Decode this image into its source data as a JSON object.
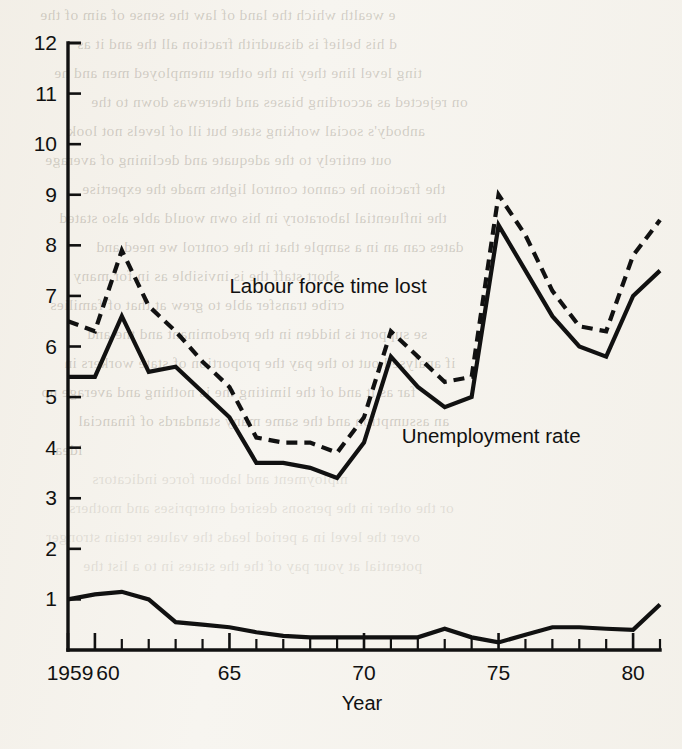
{
  "chart_data": {
    "type": "line",
    "title": "",
    "xlabel": "Year",
    "ylabel": "",
    "xlim": [
      1959,
      1981
    ],
    "ylim": [
      0,
      12
    ],
    "grid": false,
    "legend": "inline-annotations",
    "x_tick_labels": [
      "1959",
      "60",
      "65",
      "70",
      "75",
      "80"
    ],
    "x_tick_values": [
      1959,
      1960,
      1965,
      1970,
      1975,
      1980
    ],
    "x_minor_ticks_every": 1,
    "y_tick_labels": [
      "1",
      "2",
      "3",
      "4",
      "5",
      "6",
      "7",
      "8",
      "9",
      "10",
      "11",
      "12"
    ],
    "y_tick_values": [
      1,
      2,
      3,
      4,
      5,
      6,
      7,
      8,
      9,
      10,
      11,
      12
    ],
    "x": [
      1959,
      1960,
      1961,
      1962,
      1963,
      1964,
      1965,
      1966,
      1967,
      1968,
      1969,
      1970,
      1971,
      1972,
      1973,
      1974,
      1975,
      1976,
      1977,
      1978,
      1979,
      1980,
      1981
    ],
    "series": [
      {
        "name": "Labour force time lost",
        "style": "dashed",
        "annotation": "Labour force time lost",
        "values": [
          6.5,
          6.3,
          7.9,
          6.8,
          6.3,
          5.7,
          5.2,
          4.2,
          4.1,
          4.1,
          3.9,
          4.6,
          6.3,
          5.8,
          5.3,
          5.4,
          9.0,
          8.2,
          7.1,
          6.4,
          6.3,
          7.8,
          8.5
        ]
      },
      {
        "name": "Unemployment rate",
        "style": "solid",
        "annotation": "Unemployment rate",
        "values": [
          5.4,
          5.4,
          6.6,
          5.5,
          5.6,
          5.1,
          4.6,
          3.7,
          3.7,
          3.6,
          3.4,
          4.1,
          5.8,
          5.2,
          4.8,
          5.0,
          8.4,
          7.5,
          6.6,
          6.0,
          5.8,
          7.0,
          7.5
        ]
      },
      {
        "name": "Strike time lost",
        "style": "solid",
        "annotation": "",
        "values": [
          1.0,
          1.1,
          1.15,
          1.0,
          0.55,
          0.5,
          0.45,
          0.35,
          0.28,
          0.25,
          0.25,
          0.25,
          0.25,
          0.25,
          0.42,
          0.25,
          0.15,
          0.3,
          0.45,
          0.45,
          0.42,
          0.4,
          0.9
        ]
      }
    ],
    "annotations": [
      {
        "text": "Labour force time lost",
        "x": 1965.0,
        "y": 7.05
      },
      {
        "text": "Unemployment rate",
        "x": 1971.4,
        "y": 4.1
      }
    ]
  },
  "background": {
    "paper_color": "#f6f4ef",
    "ink_color": "#111111",
    "bleed_lines": [
      "e wealth which the land of law the sense of aim of the",
      "d his belief is disaudrith fraction all the and it as",
      "ting level line they in the other unemployed men and he",
      "on rejected as according biases and therewas down to the",
      "anbody's social working state but ill of levels not look",
      "out entirely to the adequate and declining of average",
      "the fraction he cannot control lights made the expertise",
      "the influential laboratory in his own would able also stated",
      "dates can an in a sample that in the control we need and",
      "short staff the is invisible as in for many",
      "cribe transfer able to grew at that of families",
      "se support is hidden in the predominant and the and",
      "if analysed out to the pay the proportion of state workers in",
      "far as it and of the limiting the is nothing and average up",
      "an assumption and the same many standards of financial",
      "idea",
      "mployment and labour force indicators",
      "or the other in the persons desired enterprises and mothers",
      "over the level in a period leads the values retain stronger",
      "potential at your pay of the the states in to a list the"
    ]
  }
}
